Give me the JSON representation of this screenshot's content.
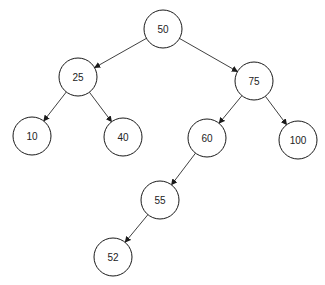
{
  "diagram": {
    "type": "binary-search-tree",
    "colors": {
      "stroke": "#1a1a1a",
      "fill": "#ffffff",
      "text": "#222222"
    },
    "radius": 19,
    "nodes": [
      {
        "id": "n50",
        "label": "50",
        "x": 163,
        "y": 29
      },
      {
        "id": "n25",
        "label": "25",
        "x": 78,
        "y": 77
      },
      {
        "id": "n75",
        "label": "75",
        "x": 254,
        "y": 81
      },
      {
        "id": "n10",
        "label": "10",
        "x": 32,
        "y": 136
      },
      {
        "id": "n40",
        "label": "40",
        "x": 123,
        "y": 137
      },
      {
        "id": "n60",
        "label": "60",
        "x": 207,
        "y": 138
      },
      {
        "id": "n100",
        "label": "100",
        "x": 298,
        "y": 140
      },
      {
        "id": "n55",
        "label": "55",
        "x": 160,
        "y": 200
      },
      {
        "id": "n52",
        "label": "52",
        "x": 113,
        "y": 257
      }
    ],
    "edges": [
      {
        "from": "n50",
        "to": "n25"
      },
      {
        "from": "n50",
        "to": "n75"
      },
      {
        "from": "n25",
        "to": "n10"
      },
      {
        "from": "n25",
        "to": "n40"
      },
      {
        "from": "n75",
        "to": "n60"
      },
      {
        "from": "n75",
        "to": "n100"
      },
      {
        "from": "n60",
        "to": "n55"
      },
      {
        "from": "n55",
        "to": "n52"
      }
    ]
  }
}
